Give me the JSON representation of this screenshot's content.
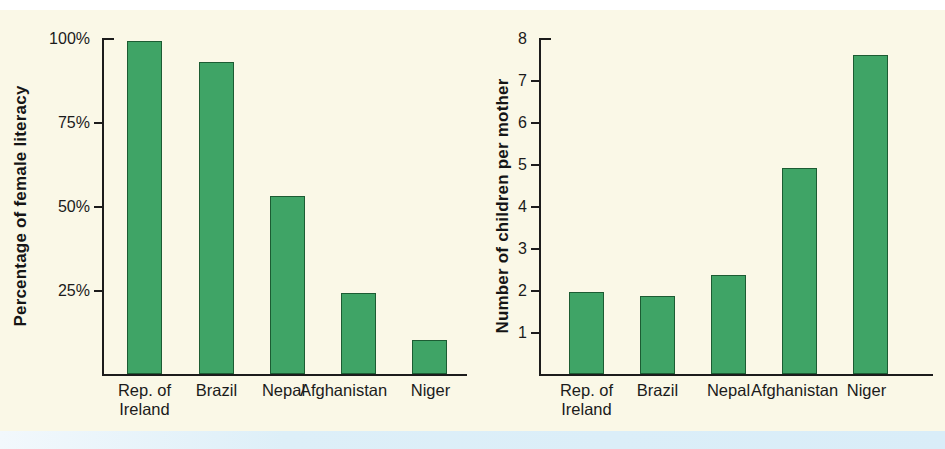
{
  "page": {
    "top_margin_color": "#ffffff",
    "panel_color": "#faf8e7",
    "bottom_band_color": "#d9edf8"
  },
  "chart_data": [
    {
      "type": "bar",
      "title": "",
      "ylabel": "Percentage of female literacy",
      "xlabel": "",
      "categories": [
        "Rep. of\nIreland",
        "Brazil",
        "Nepal",
        "Afghanistan",
        "Niger"
      ],
      "values": [
        99,
        93,
        53,
        24,
        10
      ],
      "ylim": [
        0,
        100
      ],
      "yticks": [
        25,
        50,
        75,
        100
      ],
      "ytick_labels": [
        "25%",
        "50%",
        "75%",
        "100%"
      ],
      "grid": false,
      "legend": "none",
      "bar_color": "#3fa466",
      "bar_border_color": "#1c5c33"
    },
    {
      "type": "bar",
      "title": "",
      "ylabel": "Number of children per mother",
      "xlabel": "",
      "categories": [
        "Rep. of\nIreland",
        "Brazil",
        "Nepal",
        "Afghanistan",
        "Niger"
      ],
      "values": [
        1.95,
        1.85,
        2.35,
        4.9,
        7.6
      ],
      "ylim": [
        0,
        8
      ],
      "yticks": [
        1,
        2,
        3,
        4,
        5,
        6,
        7,
        8
      ],
      "ytick_labels": [
        "1",
        "2",
        "3",
        "4",
        "5",
        "6",
        "7",
        "8"
      ],
      "grid": false,
      "legend": "none",
      "bar_color": "#3fa466",
      "bar_border_color": "#1c5c33"
    }
  ]
}
